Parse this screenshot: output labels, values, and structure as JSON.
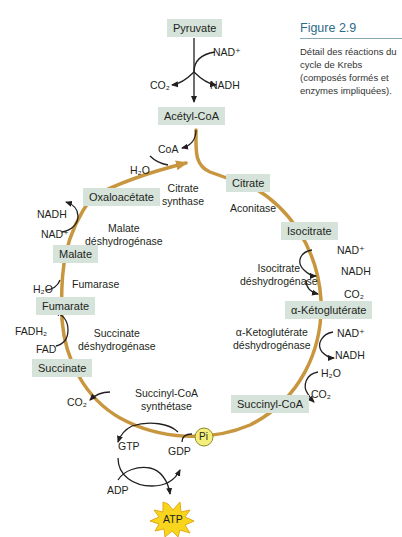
{
  "figure": {
    "title": "Figure 2.9",
    "caption": "Détail des réactions du cycle de Krebs (composés formés et enzymes impliquées)."
  },
  "colors": {
    "cycle_path": "#c8963e",
    "compound_box": "#d5e3da",
    "arrow": "#231f20",
    "atp_burst": "#f7d51d",
    "pi_circle": "#f4ee7a",
    "caption_title": "#2e6b87"
  },
  "compounds": {
    "pyruvate": "Pyruvate",
    "acetyl_coa": "Acétyl-CoA",
    "citrate": "Citrate",
    "isocitrate": "Isocitrate",
    "alpha_ketoglutarate": "α-Kétoglutérate",
    "succinyl_coa": "Succinyl-CoA",
    "succinate": "Succinate",
    "fumarate": "Fumarate",
    "malate": "Malate",
    "oxaloacetate": "Oxaloacétate"
  },
  "enzymes": {
    "citrate_synthase": [
      "Citrate",
      "synthase"
    ],
    "aconitase": [
      "Aconitase"
    ],
    "isocitrate_dh": [
      "Isocitrate",
      "déshydrogénase"
    ],
    "akg_dh": [
      "α-Ketoglutérate",
      "déshydrogénase"
    ],
    "succinyl_coa_synthetase": [
      "Succinyl-CoA",
      "synthétase"
    ],
    "succinate_dh": [
      "Succinate",
      "déshydrogénase"
    ],
    "fumarase": [
      "Fumarase"
    ],
    "malate_dh": [
      "Malate",
      "déshydrogénase"
    ]
  },
  "cofactors": {
    "pdh_nad": "NAD⁺",
    "pdh_co2": "CO₂",
    "pdh_nadh": "NADH",
    "coa": "CoA",
    "cs_h2o": "H₂O",
    "idh_nad": "NAD⁺",
    "idh_nadh": "NADH",
    "idh_co2": "CO₂",
    "akg_nad": "NAD⁺",
    "akg_nadh": "NADH",
    "akg_h2o": "H₂O",
    "akg_co2": "CO₂",
    "scs_co2": "CO₂",
    "sdh_fadh2": "FADH₂",
    "sdh_fad": "FAD",
    "fum_h2o": "H₂O",
    "mdh_nadh": "NADH",
    "mdh_nad": "NAD⁺",
    "gtp": "GTP",
    "gdp": "GDP",
    "pi": "Pi",
    "adp": "ADP",
    "atp": "ATP"
  }
}
